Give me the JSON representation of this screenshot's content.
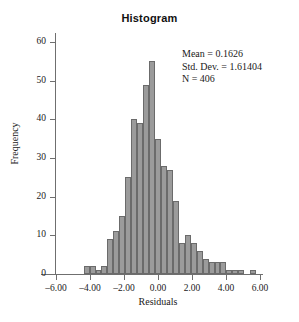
{
  "chart_data": {
    "type": "bar",
    "title": "Histogram",
    "xlabel": "Residuals",
    "ylabel": "Frequency",
    "xlim": [
      -6.0,
      6.0
    ],
    "ylim": [
      0,
      60
    ],
    "grid": false,
    "legend": null,
    "bin_width": 0.35,
    "x_tick_labels": [
      "–6.00",
      "–4.00",
      "–2.00",
      "0.00",
      "2.00",
      "4.00",
      "6.00"
    ],
    "x_tick_values": [
      -6.0,
      -4.0,
      -2.0,
      0.0,
      2.0,
      4.0,
      6.0
    ],
    "y_tick_labels": [
      "0",
      "10",
      "20",
      "30",
      "40",
      "50",
      "60"
    ],
    "y_tick_values": [
      0,
      10,
      20,
      30,
      40,
      50,
      60
    ],
    "bin_centers": [
      -4.2,
      -3.85,
      -3.5,
      -3.15,
      -2.8,
      -2.45,
      -2.1,
      -1.75,
      -1.4,
      -1.05,
      -0.7,
      -0.35,
      0.0,
      0.35,
      0.7,
      1.05,
      1.4,
      1.75,
      2.1,
      2.45,
      2.8,
      3.15,
      3.5,
      3.85,
      4.2,
      4.55,
      4.9,
      5.6
    ],
    "values": [
      2,
      2,
      1,
      2,
      9,
      11,
      15,
      25,
      40,
      39,
      49,
      55,
      35,
      28,
      27,
      19,
      8,
      10,
      8,
      6,
      4,
      3,
      3,
      3,
      1,
      1,
      1,
      1
    ],
    "categories": [
      "-4.20",
      "-3.85",
      "-3.50",
      "-3.15",
      "-2.80",
      "-2.45",
      "-2.10",
      "-1.75",
      "-1.40",
      "-1.05",
      "-0.70",
      "-0.35",
      "0.00",
      "0.35",
      "0.70",
      "1.05",
      "1.40",
      "1.75",
      "2.10",
      "2.45",
      "2.80",
      "3.15",
      "3.50",
      "3.85",
      "4.20",
      "4.55",
      "4.90",
      "5.60"
    ],
    "annotations": {
      "mean_label": "Mean = 0.1626",
      "stddev_label": "Std. Dev. = 1.61404",
      "n_label": "N = 406"
    },
    "colors": {
      "bar_fill": "#9b9b9b",
      "bar_stroke": "#6b6b6b",
      "axis": "#6f6f6f",
      "text": "#1a1a1a",
      "background": "#ffffff"
    }
  }
}
